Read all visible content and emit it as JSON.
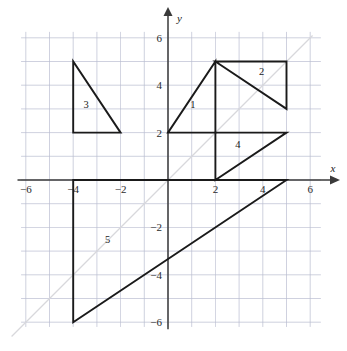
{
  "figure": {
    "axes": {
      "x_axis_label": "x",
      "y_axis_label": "y",
      "x_ticks": [
        {
          "value": -6,
          "label": "−6"
        },
        {
          "value": -4,
          "label": "−4"
        },
        {
          "value": -2,
          "label": "−2"
        },
        {
          "value": 2,
          "label": "2"
        },
        {
          "value": 4,
          "label": "4"
        },
        {
          "value": 6,
          "label": "6"
        }
      ],
      "y_ticks": [
        {
          "value": 6,
          "label": "6"
        },
        {
          "value": 4,
          "label": "4"
        },
        {
          "value": 2,
          "label": "2"
        },
        {
          "value": -2,
          "label": "−2"
        },
        {
          "value": -4,
          "label": "−4"
        },
        {
          "value": -6,
          "label": "−6"
        }
      ],
      "xlim": [
        -6.2,
        6.45
      ],
      "ylim": [
        -6.2,
        6.25
      ],
      "grid": true,
      "grid_color": "#b9bcd0",
      "axis_color": "#3a3a3a"
    },
    "reference_line": {
      "name": "y = x",
      "color": "#d8d8dc",
      "from": [
        -6.6,
        -6.6
      ],
      "to": [
        6.1,
        6.1
      ]
    },
    "shapes": [
      {
        "label": "1",
        "label_at": [
          1.05,
          3.05
        ],
        "points": [
          [
            0,
            2
          ],
          [
            2,
            5
          ],
          [
            2,
            2
          ]
        ],
        "color": "#1a1a1a"
      },
      {
        "label": "2",
        "label_at": [
          3.95,
          4.45
        ],
        "points": [
          [
            2,
            5
          ],
          [
            5,
            5
          ],
          [
            5,
            3
          ]
        ],
        "color": "#1a1a1a"
      },
      {
        "label": "3",
        "label_at": [
          -3.45,
          3.05
        ],
        "points": [
          [
            -4,
            5
          ],
          [
            -4,
            2
          ],
          [
            -2,
            2
          ]
        ],
        "color": "#1a1a1a"
      },
      {
        "label": "4",
        "label_at": [
          2.95,
          1.35
        ],
        "points": [
          [
            2,
            2
          ],
          [
            5,
            2
          ],
          [
            2,
            0
          ]
        ],
        "color": "#1a1a1a"
      },
      {
        "label": "5",
        "label_at": [
          -2.55,
          -2.65
        ],
        "points": [
          [
            -4,
            0
          ],
          [
            -4,
            -6
          ],
          [
            5,
            0
          ]
        ],
        "color": "#1a1a1a"
      }
    ]
  }
}
